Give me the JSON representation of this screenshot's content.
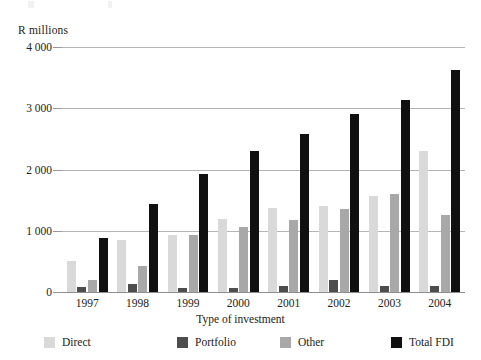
{
  "chart_data": {
    "type": "bar",
    "title": "",
    "subtitle": "",
    "xlabel": "Type of investment",
    "ylabel": "R millions",
    "categories": [
      "1997",
      "1998",
      "1999",
      "2000",
      "2001",
      "2002",
      "2003",
      "2004"
    ],
    "series": [
      {
        "name": "Direct",
        "color": "#d9d9d9",
        "values": [
          500,
          850,
          930,
          1190,
          1370,
          1400,
          1570,
          2300
        ]
      },
      {
        "name": "Portfolio",
        "color": "#4d4d4d",
        "values": [
          80,
          130,
          60,
          70,
          100,
          200,
          100,
          100
        ]
      },
      {
        "name": "Other",
        "color": "#a8a8a8",
        "values": [
          200,
          420,
          930,
          1060,
          1180,
          1350,
          1600,
          1250
        ]
      },
      {
        "name": "Total FDI",
        "color": "#101010",
        "values": [
          880,
          1430,
          1930,
          2300,
          2580,
          2900,
          3140,
          3620
        ]
      }
    ],
    "ylim": [
      0,
      4000
    ],
    "yticks": [
      0,
      1000,
      2000,
      3000,
      4000
    ],
    "ytick_labels": [
      "0",
      "1 000",
      "2 000",
      "3 000",
      "4 000"
    ],
    "grid": true,
    "legend_position": "bottom"
  },
  "legend": {
    "items": [
      {
        "label": "Direct"
      },
      {
        "label": "Portfolio"
      },
      {
        "label": "Other"
      },
      {
        "label": "Total FDI"
      }
    ]
  }
}
